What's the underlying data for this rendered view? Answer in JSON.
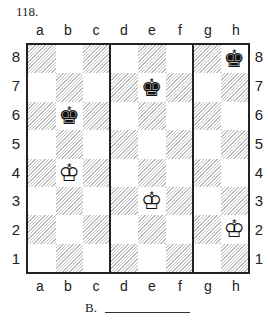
{
  "problem_number": "118.",
  "files": [
    "a",
    "b",
    "c",
    "d",
    "e",
    "f",
    "g",
    "h"
  ],
  "ranks": [
    "8",
    "7",
    "6",
    "5",
    "4",
    "3",
    "2",
    "1"
  ],
  "separators_after_files": [
    "c",
    "f"
  ],
  "pieces": [
    {
      "square": "h8",
      "type": "king",
      "color": "black",
      "glyph": "♚"
    },
    {
      "square": "e7",
      "type": "king",
      "color": "black",
      "glyph": "♚"
    },
    {
      "square": "b6",
      "type": "king",
      "color": "black",
      "glyph": "♚"
    },
    {
      "square": "b4",
      "type": "king",
      "color": "white",
      "glyph": "♔"
    },
    {
      "square": "e3",
      "type": "king",
      "color": "white",
      "glyph": "♔"
    },
    {
      "square": "h2",
      "type": "king",
      "color": "white",
      "glyph": "♔"
    }
  ],
  "answer": {
    "label": "B.",
    "blank": ""
  }
}
